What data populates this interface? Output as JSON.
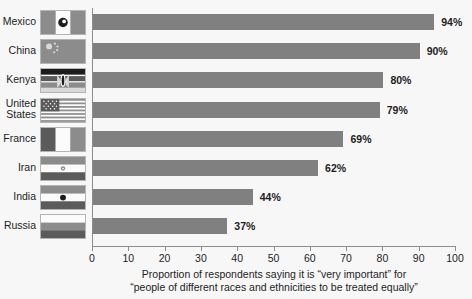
{
  "chart_data": {
    "type": "bar",
    "orientation": "horizontal",
    "title": "",
    "subtitle": "",
    "xlabel_line1": "Proportion of respondents saying it is “very important” for",
    "xlabel_line2": "“people of different races and ethnicities to be treated equally”",
    "ylabel": "",
    "categories": [
      "Mexico",
      "China",
      "Kenya",
      "United States",
      "France",
      "Iran",
      "India",
      "Russia"
    ],
    "values": [
      94,
      90,
      80,
      79,
      69,
      62,
      44,
      37
    ],
    "value_labels": [
      "94%",
      "90%",
      "80%",
      "79%",
      "69%",
      "62%",
      "44%",
      "37%"
    ],
    "xlim": [
      0,
      100
    ],
    "xticks": [
      0,
      10,
      20,
      30,
      40,
      50,
      60,
      70,
      80,
      90,
      100
    ],
    "xtick_labels": [
      "0",
      "10",
      "20",
      "30",
      "40",
      "50",
      "60",
      "70",
      "80",
      "90",
      "100"
    ],
    "grid": false,
    "legend": null,
    "bar_color": "#808080",
    "axis_color": "#8d8d8d",
    "text_color": "#1d1d1d",
    "background_color": "#f7f7f7"
  },
  "rows": [
    {
      "country": "Mexico",
      "label_lines": [
        "Mexico"
      ],
      "value": 94,
      "value_label": "94%",
      "flag": "flag-mexico"
    },
    {
      "country": "China",
      "label_lines": [
        "China"
      ],
      "value": 90,
      "value_label": "90%",
      "flag": "flag-china"
    },
    {
      "country": "Kenya",
      "label_lines": [
        "Kenya"
      ],
      "value": 80,
      "value_label": "80%",
      "flag": "flag-kenya"
    },
    {
      "country": "United States",
      "label_lines": [
        "United",
        "States"
      ],
      "value": 79,
      "value_label": "79%",
      "flag": "flag-united-states"
    },
    {
      "country": "France",
      "label_lines": [
        "France"
      ],
      "value": 69,
      "value_label": "69%",
      "flag": "flag-france"
    },
    {
      "country": "Iran",
      "label_lines": [
        "Iran"
      ],
      "value": 62,
      "value_label": "62%",
      "flag": "flag-iran"
    },
    {
      "country": "India",
      "label_lines": [
        "India"
      ],
      "value": 44,
      "value_label": "44%",
      "flag": "flag-india"
    },
    {
      "country": "Russia",
      "label_lines": [
        "Russia"
      ],
      "value": 37,
      "value_label": "37%",
      "flag": "flag-russia"
    }
  ]
}
